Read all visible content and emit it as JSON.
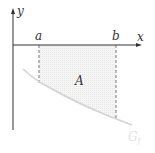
{
  "labels": {
    "y_axis": "y",
    "x_axis": "x",
    "a": "a",
    "b": "b",
    "area": "A",
    "curve": "G",
    "curve_sub": "f"
  },
  "colors": {
    "axis": "#333333",
    "curve": "#d8d8d8",
    "fill": "#f0f0f0",
    "dash": "#555555"
  }
}
